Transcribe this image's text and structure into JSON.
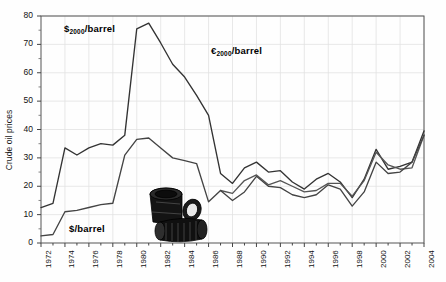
{
  "figure": {
    "width": 446,
    "height": 282,
    "background": "#fefefe",
    "plot_frame_color": "#555555",
    "grid_color": "#e2e2e2"
  },
  "axis": {
    "y_title": "Crude oil prices",
    "y_ticks": [
      "0",
      "10",
      "20",
      "30",
      "40",
      "50",
      "60",
      "70",
      "80"
    ],
    "y_min": 0,
    "y_max": 80,
    "x_ticks": [
      "1972",
      "1974",
      "1976",
      "1978",
      "1980",
      "1982",
      "1984",
      "1986",
      "1988",
      "1990",
      "1992",
      "1994",
      "1996",
      "1998",
      "2000",
      "2002",
      "2004"
    ],
    "x_min": 1972,
    "x_max": 2004
  },
  "annotations": [
    {
      "name": "dollar2000-label",
      "text_prefix": "$",
      "text_sub": "2000",
      "text_suffix": "/barrel",
      "x": 64,
      "y": 23
    },
    {
      "name": "euro2000-label",
      "text_prefix": "€",
      "text_sub": "2000",
      "text_suffix": "/barrel",
      "x": 211,
      "y": 45
    },
    {
      "name": "dollar-nominal-label",
      "text_prefix": "$",
      "text_sub": "",
      "text_suffix": "/barrel",
      "x": 69,
      "y": 223
    }
  ],
  "artwork": {
    "name": "oil-barrels-illustration",
    "description": "two black oil drums, one upright one tipped"
  },
  "chart_data": {
    "type": "line",
    "title": "",
    "xlabel": "",
    "ylabel": "Crude oil prices",
    "xlim": [
      1972,
      2004
    ],
    "ylim": [
      0,
      80
    ],
    "grid": true,
    "legend_position": "inline-annotations",
    "x": [
      1972,
      1973,
      1974,
      1975,
      1976,
      1977,
      1978,
      1979,
      1980,
      1981,
      1982,
      1983,
      1984,
      1985,
      1986,
      1987,
      1988,
      1989,
      1990,
      1991,
      1992,
      1993,
      1994,
      1995,
      1996,
      1997,
      1998,
      1999,
      2000,
      2001,
      2002,
      2003,
      2004
    ],
    "series": [
      {
        "name": "$2000/barrel",
        "label": "$2000/barrel",
        "color": "#333333",
        "values": [
          12.5,
          14.0,
          33.5,
          31.0,
          33.5,
          35.0,
          34.5,
          38.0,
          75.5,
          77.5,
          70.5,
          63.0,
          58.5,
          52.0,
          45.0,
          24.5,
          21.0,
          26.5,
          28.5,
          25.0,
          25.5,
          21.5,
          19.0,
          22.5,
          24.5,
          21.5,
          16.0,
          22.5,
          33.0,
          26.0,
          27.0,
          28.5,
          39.5
        ]
      },
      {
        "name": "€2000/barrel",
        "label": "€2000/barrel",
        "color": "#555555",
        "values": [
          null,
          null,
          null,
          null,
          null,
          null,
          null,
          null,
          null,
          null,
          null,
          null,
          null,
          null,
          null,
          18.5,
          17.5,
          22.0,
          24.0,
          20.5,
          22.0,
          20.0,
          18.0,
          18.5,
          21.0,
          21.0,
          16.5,
          22.0,
          32.0,
          27.5,
          26.0,
          26.5,
          38.0
        ]
      },
      {
        "name": "$/barrel",
        "label": "$/barrel",
        "color": "#444444",
        "values": [
          2.5,
          3.0,
          11.0,
          11.5,
          12.5,
          13.5,
          14.0,
          31.0,
          36.5,
          37.0,
          33.5,
          30.0,
          29.0,
          28.0,
          14.5,
          18.5,
          15.0,
          18.0,
          23.5,
          20.0,
          19.5,
          17.0,
          16.0,
          17.0,
          20.5,
          19.0,
          13.0,
          18.0,
          28.5,
          24.5,
          25.0,
          28.5,
          38.0
        ]
      }
    ]
  }
}
